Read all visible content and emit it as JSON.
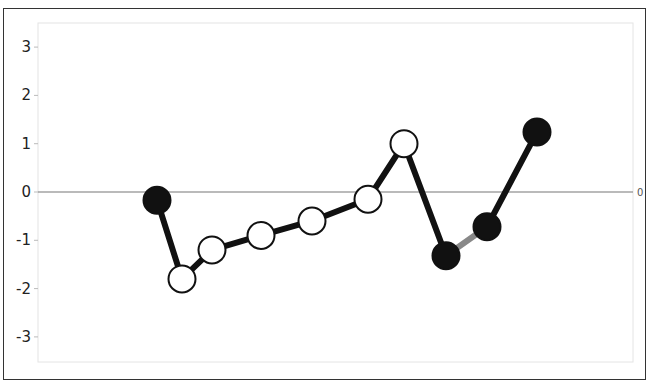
{
  "chart_data": {
    "type": "line",
    "title": "",
    "xlabel": "",
    "ylabel": "",
    "ylim": [
      -3.5,
      3.5
    ],
    "yticks": [
      3,
      2,
      1,
      0,
      -1,
      -2,
      -3
    ],
    "grid": false,
    "reference_line": {
      "y": 0,
      "label": "0",
      "color": "#777777"
    },
    "series": [
      {
        "name": "values",
        "points": [
          {
            "x": 1,
            "y": -0.17,
            "fill": "black"
          },
          {
            "x": 2,
            "y": -1.8,
            "fill": "white"
          },
          {
            "x": 3,
            "y": -1.2,
            "fill": "white"
          },
          {
            "x": 4,
            "y": -0.9,
            "fill": "white"
          },
          {
            "x": 5,
            "y": -0.6,
            "fill": "white"
          },
          {
            "x": 6,
            "y": -0.15,
            "fill": "white"
          },
          {
            "x": 7,
            "y": 1.0,
            "fill": "white"
          },
          {
            "x": 8,
            "y": -1.32,
            "fill": "black"
          },
          {
            "x": 9,
            "y": -0.72,
            "fill": "black"
          },
          {
            "x": 10,
            "y": 1.24,
            "fill": "black"
          }
        ],
        "x_px": [
          157,
          182,
          212,
          261,
          312,
          368,
          404,
          446,
          487,
          537
        ],
        "segment_colors": [
          "#111111",
          "#111111",
          "#111111",
          "#111111",
          "#111111",
          "#111111",
          "#111111",
          "#888888",
          "#111111"
        ]
      }
    ]
  },
  "axis": {
    "y_labels": [
      "3",
      "2",
      "1",
      "0",
      "-1",
      "-2",
      "-3"
    ],
    "right_label": "0"
  }
}
